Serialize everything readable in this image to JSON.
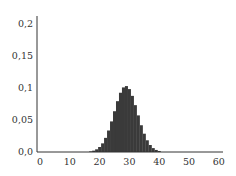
{
  "chart_data": {
    "type": "bar",
    "title": "",
    "xlabel": "",
    "ylabel": "",
    "xlim": [
      0,
      60
    ],
    "ylim": [
      0,
      0.2
    ],
    "grid": false,
    "legend": null,
    "x_ticks": [
      "0",
      "10",
      "20",
      "30",
      "40",
      "50",
      "60"
    ],
    "y_ticks": [
      "0,0",
      "0,05",
      "0,1",
      "0,15",
      "0,2"
    ],
    "y_tick_values": [
      0,
      0.05,
      0.1,
      0.15,
      0.2
    ],
    "x_tick_values": [
      0,
      10,
      20,
      30,
      40,
      50,
      60
    ],
    "categories": [
      17,
      18,
      19,
      20,
      21,
      22,
      23,
      24,
      25,
      26,
      27,
      28,
      29,
      30,
      31,
      32,
      33,
      34,
      35,
      36,
      37,
      38,
      39,
      40
    ],
    "values": [
      0.001,
      0.0021,
      0.0042,
      0.0078,
      0.0135,
      0.0221,
      0.0336,
      0.0478,
      0.0637,
      0.0794,
      0.0926,
      0.1009,
      0.103,
      0.0983,
      0.0877,
      0.0732,
      0.0572,
      0.0418,
      0.0286,
      0.0183,
      0.0109,
      0.0061,
      0.0032,
      0.0016
    ],
    "bar_color": "#3a3a3a",
    "axis_color": "#333333"
  }
}
